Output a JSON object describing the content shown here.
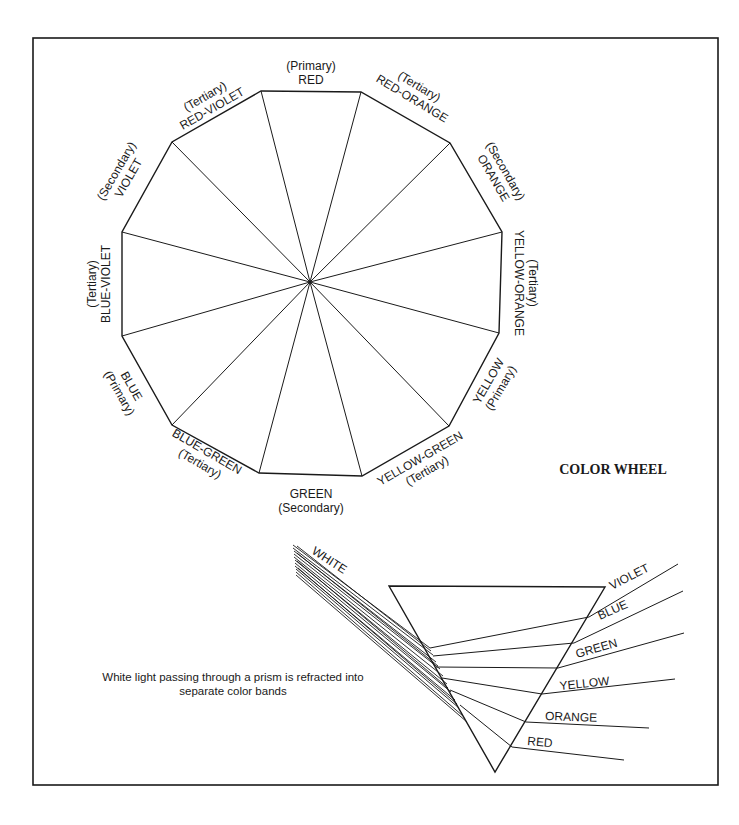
{
  "diagram": {
    "title": "COLOR WHEEL",
    "wheel": {
      "segments": [
        {
          "name": "RED",
          "type": "(Primary)"
        },
        {
          "name": "RED-ORANGE",
          "type": "(Tertiary)"
        },
        {
          "name": "ORANGE",
          "type": "(Secondary)"
        },
        {
          "name": "YELLOW-ORANGE",
          "type": "(Tertiary)"
        },
        {
          "name": "YELLOW",
          "type": "(Primary)"
        },
        {
          "name": "YELLOW-GREEN",
          "type": "(Tertiary)"
        },
        {
          "name": "GREEN",
          "type": "(Secondary)"
        },
        {
          "name": "BLUE-GREEN",
          "type": "(Tertiary)"
        },
        {
          "name": "BLUE",
          "type": "(Primary)"
        },
        {
          "name": "BLUE-VIOLET",
          "type": "(Tertiary)"
        },
        {
          "name": "VIOLET",
          "type": "(Secondary)"
        },
        {
          "name": "RED-VIOLET",
          "type": "(Tertiary)"
        }
      ]
    },
    "prism": {
      "input_label": "WHITE",
      "bands": [
        "VIOLET",
        "BLUE",
        "GREEN",
        "YELLOW",
        "ORANGE",
        "RED"
      ],
      "caption_line1": "White light passing through a prism is refracted into",
      "caption_line2": "separate color bands"
    }
  }
}
